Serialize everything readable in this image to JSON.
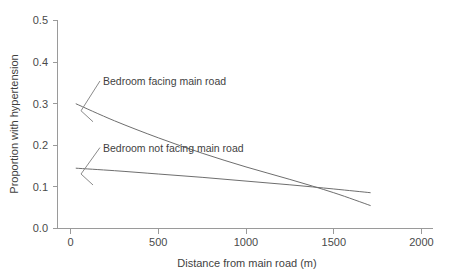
{
  "chart_data": {
    "type": "line",
    "title": "",
    "subtitle": "",
    "xlabel": "Distance from main road (m)",
    "ylabel": "Proportion with hypertension",
    "xlim": [
      0,
      2000
    ],
    "ylim": [
      0.0,
      0.5
    ],
    "xticks": [
      0,
      500,
      1000,
      1500,
      2000
    ],
    "xtick_labels": [
      "0",
      "500",
      "1000",
      "1500",
      "2000"
    ],
    "yticks": [
      0.0,
      0.1,
      0.2,
      0.3,
      0.4,
      0.5
    ],
    "ytick_labels": [
      "0.0",
      "0.1",
      "0.2",
      "0.3",
      "0.4",
      "0.5"
    ],
    "grid": false,
    "legend_position": "inline-annotations",
    "line_color": "#6e6e6e",
    "axis_color": "#9a9a9a",
    "series": [
      {
        "name": "Bedroom facing main road",
        "x": [
          30,
          250,
          500,
          750,
          1000,
          1250,
          1500,
          1710
        ],
        "values": [
          0.3,
          0.259,
          0.218,
          0.181,
          0.148,
          0.118,
          0.086,
          0.055
        ]
      },
      {
        "name": "Bedroom not facing main road",
        "x": [
          30,
          250,
          500,
          750,
          1000,
          1250,
          1500,
          1710
        ],
        "values": [
          0.145,
          0.139,
          0.131,
          0.123,
          0.114,
          0.105,
          0.095,
          0.086
        ]
      }
    ],
    "annotations": [
      {
        "text": "Bedroom facing main road",
        "label_x": 185,
        "label_y": 0.345,
        "points_to_x": 60,
        "points_to_y": 0.295
      },
      {
        "text": "Bedroom not facing main road",
        "label_x": 185,
        "label_y": 0.185,
        "points_to_x": 60,
        "points_to_y": 0.143
      }
    ],
    "crossover": {
      "x": 1110,
      "y": 0.101
    }
  }
}
